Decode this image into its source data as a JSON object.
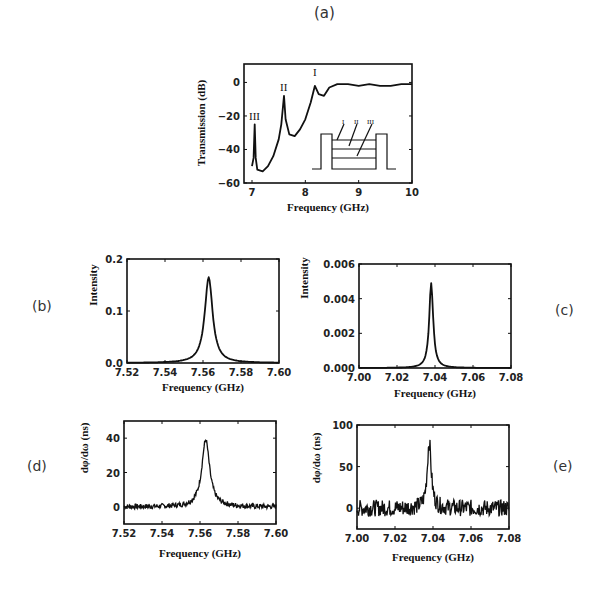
{
  "panel_labels": {
    "a": "(a)",
    "b": "(b)",
    "c": "(c)",
    "d": "(d)",
    "e": "(e)"
  },
  "chart_data": [
    {
      "id": "a",
      "type": "line",
      "title": "(a)",
      "xlabel": "Frequency (GHz)",
      "ylabel": "Transmission (dB)",
      "xlim": [
        7,
        10
      ],
      "ylim": [
        -60,
        10
      ],
      "xticks": [
        "7",
        "8",
        "9",
        "10"
      ],
      "yticks": [
        "0",
        "-20",
        "-40",
        "-60"
      ],
      "annotations": [
        {
          "text": "III",
          "x": 7.05,
          "y": -25
        },
        {
          "text": "II",
          "x": 7.6,
          "y": -8
        },
        {
          "text": "I",
          "x": 8.18,
          "y": -2
        }
      ],
      "inset": {
        "description": "step-profile schematic with three layers",
        "labels": [
          "I",
          "II",
          "III"
        ]
      },
      "x": [
        7.0,
        7.03,
        7.05,
        7.07,
        7.1,
        7.2,
        7.3,
        7.4,
        7.5,
        7.55,
        7.6,
        7.63,
        7.7,
        7.8,
        7.9,
        8.0,
        8.1,
        8.18,
        8.25,
        8.35,
        8.45,
        8.6,
        8.8,
        9.0,
        9.2,
        9.4,
        9.6,
        9.8,
        10.0
      ],
      "y": [
        -50,
        -45,
        -25,
        -45,
        -52,
        -53,
        -50,
        -44,
        -34,
        -25,
        -8,
        -22,
        -31,
        -32,
        -28,
        -22,
        -12,
        -2,
        -7,
        -8,
        -3,
        -1,
        -1,
        -2,
        -1,
        -2,
        -2,
        -1,
        -1
      ]
    },
    {
      "id": "b",
      "type": "line",
      "title": "(b)",
      "xlabel": "Frequency (GHz)",
      "ylabel": "Intensity",
      "xlim": [
        7.52,
        7.6
      ],
      "ylim": [
        0.0,
        0.2
      ],
      "xticks": [
        "7.52",
        "7.54",
        "7.56",
        "7.58",
        "7.60"
      ],
      "yticks": [
        "0.0",
        "0.1",
        "0.2"
      ],
      "peak": {
        "x": 7.563,
        "y": 0.165,
        "fwhm_ghz": 0.005
      }
    },
    {
      "id": "c",
      "type": "line",
      "title": "(c)",
      "xlabel": "Frequency (GHz)",
      "ylabel": "Intensity",
      "xlim": [
        7.0,
        7.08
      ],
      "ylim": [
        0.0,
        0.006
      ],
      "xticks": [
        "7.00",
        "7.02",
        "7.04",
        "7.06",
        "7.08"
      ],
      "yticks": [
        "0.000",
        "0.002",
        "0.004",
        "0.006"
      ],
      "peak": {
        "x": 7.038,
        "y": 0.0049,
        "fwhm_ghz": 0.0025
      }
    },
    {
      "id": "d",
      "type": "line",
      "title": "(d)",
      "xlabel": "Frequency (GHz)",
      "ylabel": "dφ/dω (ns)",
      "xlim": [
        7.52,
        7.6
      ],
      "ylim": [
        -10,
        50
      ],
      "xticks": [
        "7.52",
        "7.54",
        "7.56",
        "7.58",
        "7.60"
      ],
      "yticks": [
        "0",
        "20",
        "40"
      ],
      "peak": {
        "x": 7.563,
        "y": 39,
        "fwhm_ghz": 0.005
      },
      "noise_amplitude": 1.5
    },
    {
      "id": "e",
      "type": "line",
      "title": "(e)",
      "xlabel": "Frequency (GHz)",
      "ylabel": "dφ/dω (ns)",
      "xlim": [
        7.0,
        7.08
      ],
      "ylim": [
        -25,
        100
      ],
      "xticks": [
        "7.00",
        "7.02",
        "7.04",
        "7.06",
        "7.08"
      ],
      "yticks": [
        "0",
        "50",
        "100"
      ],
      "peak": {
        "x": 7.038,
        "y": 80,
        "fwhm_ghz": 0.0025
      },
      "noise_amplitude": 10
    }
  ]
}
